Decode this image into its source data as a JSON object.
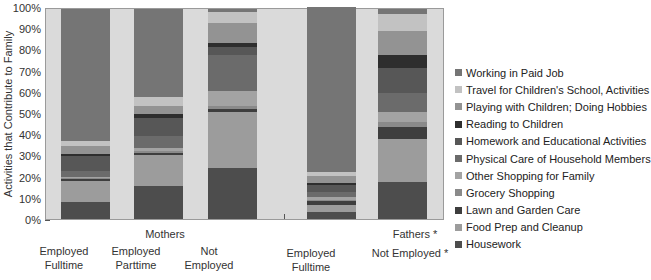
{
  "chart_data": {
    "type": "bar",
    "stacked": true,
    "title": "",
    "xlabel": "",
    "ylabel": "Activities that Contribute to Family",
    "ylim": [
      0,
      100
    ],
    "yticks": [
      "0%",
      "10%",
      "20%",
      "30%",
      "40%",
      "50%",
      "60%",
      "70%",
      "80%",
      "90%",
      "100%"
    ],
    "grid": false,
    "legend_position": "right",
    "groups": [
      {
        "label": "Mothers",
        "categories": [
          "Employed Fulltime",
          "Employed Parttime",
          "Not Employed"
        ]
      },
      {
        "label": "Fathers *",
        "categories": [
          "Employed Fulltime",
          "Not Employed *"
        ]
      }
    ],
    "categories": [
      "Mothers - Employed Fulltime",
      "Mothers - Employed Parttime",
      "Mothers - Not Employed",
      "Fathers - Employed Fulltime",
      "Fathers - Not Employed *"
    ],
    "category_labels": [
      [
        "Employed",
        "Fulltime"
      ],
      [
        "Employed",
        "Parttime"
      ],
      [
        "Not",
        "Employed"
      ],
      [
        "Employed",
        "Fulltime"
      ],
      [
        "Not Employed *",
        ""
      ]
    ],
    "series": [
      {
        "name": "Housework",
        "color": "#4d4d4d",
        "values": [
          8,
          15.5,
          24.5,
          3.3,
          17.5
        ]
      },
      {
        "name": "Food Prep and Cleanup",
        "color": "#9c9c9c",
        "values": [
          10,
          15,
          26.5,
          3.3,
          20.5
        ]
      },
      {
        "name": "Lawn and Garden Care",
        "color": "#3e3e3e",
        "values": [
          1.2,
          1,
          1.5,
          1.9,
          6
        ]
      },
      {
        "name": "Grocery Shopping",
        "color": "#8a8a8a",
        "values": [
          0.3,
          1,
          1.5,
          0.5,
          2
        ]
      },
      {
        "name": "Other Shopping for Family",
        "color": "#a3a3a3",
        "values": [
          0.3,
          1.5,
          7,
          1.4,
          5
        ]
      },
      {
        "name": "Physical Care of Household Members",
        "color": "#6b6b6b",
        "values": [
          3.2,
          5.6,
          17,
          2.3,
          9
        ]
      },
      {
        "name": "Homework and Educational Activities",
        "color": "#575757",
        "values": [
          7,
          8.4,
          4,
          3.3,
          11.7
        ]
      },
      {
        "name": "Reading to Children",
        "color": "#2e2e2e",
        "values": [
          1,
          2,
          2,
          1,
          6.3
        ]
      },
      {
        "name": "Playing with Children; Doing Hobbies",
        "color": "#939393",
        "values": [
          4,
          4,
          9.5,
          3.6,
          11.6
        ]
      },
      {
        "name": "Travel for Children's School, Activities",
        "color": "#c2c2c2",
        "values": [
          2,
          4,
          5,
          1.6,
          8
        ]
      },
      {
        "name": "Working in Paid Job",
        "color": "#757575",
        "values": [
          63,
          42,
          1.5,
          78.8,
          2.4
        ]
      }
    ],
    "legend": [
      "Working in Paid Job",
      "Travel for Children's School, Activities",
      "Playing with Children; Doing Hobbies",
      "Reading to Children",
      "Homework and Educational Activities",
      "Physical Care of Household Members",
      "Other Shopping for Family",
      "Grocery Shopping",
      "Lawn and Garden Care",
      "Food Prep and Cleanup",
      "Housework"
    ]
  },
  "colors": {
    "plot_background": "#dadada",
    "axis": "#9a9a9a"
  }
}
